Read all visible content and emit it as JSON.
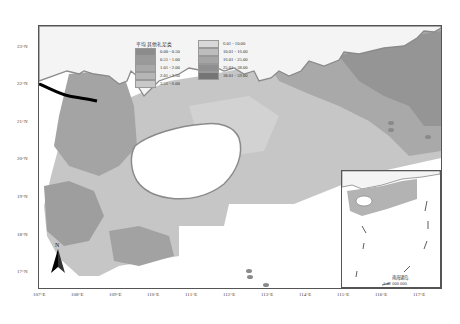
{
  "map": {
    "title": "",
    "latitude_labels": [
      "23°N",
      "22°N",
      "21°N",
      "20°N",
      "19°N",
      "18°N",
      "17°N"
    ],
    "longitude_labels": [
      "107°E",
      "108°E",
      "109°E",
      "110°E",
      "111°E",
      "112°E",
      "113°E",
      "114°E",
      "115°E",
      "116°E",
      "117°E"
    ],
    "north_arrow_label": "N"
  },
  "legend": {
    "title": "平均 其他礼足类",
    "items": [
      {
        "label": "0.00 - 0.50",
        "color": "#8c8c8c"
      },
      {
        "label": "0.51 - 1.00",
        "color": "#9a9a9a"
      },
      {
        "label": "1.01 - 2.00",
        "color": "#a8a8a8"
      },
      {
        "label": "2.01 - 3.50",
        "color": "#b6b6b6"
      },
      {
        "label": "3.51 - 6.00",
        "color": "#c8c8c8"
      },
      {
        "label": "6.01 - 10.00",
        "color": "#d8d8d8"
      },
      {
        "label": "10.01 - 16.00",
        "color": "#bdbdbd"
      },
      {
        "label": "16.01 - 25.00",
        "color": "#a5a5a5"
      },
      {
        "label": "25.01 - 38.00",
        "color": "#8f8f8f"
      },
      {
        "label": "38.01 - 59.00",
        "color": "#757575"
      }
    ]
  },
  "inset": {
    "title": "南海诸岛",
    "scale": "1:42 000 000"
  }
}
